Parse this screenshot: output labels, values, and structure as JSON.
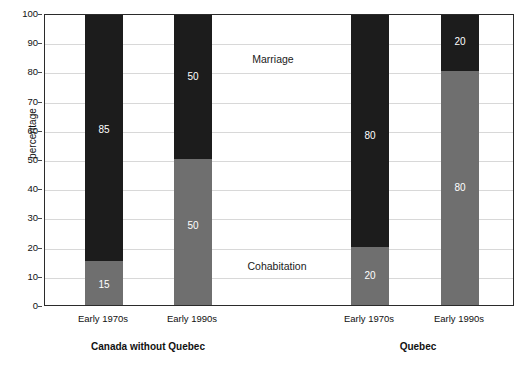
{
  "chart_data": {
    "type": "bar",
    "subtype": "stacked-100-percent",
    "title": "",
    "xlabel": "",
    "ylabel": "percentage",
    "ylim": [
      0,
      100
    ],
    "yticks": [
      0,
      10,
      20,
      30,
      40,
      50,
      60,
      70,
      80,
      90,
      100
    ],
    "grid": true,
    "legend_position": "in-plot-annotations",
    "categories": [
      "Early 1970s",
      "Early 1990s",
      "Early 1970s",
      "Early 1990s"
    ],
    "groups": [
      {
        "name": "Canada without Quebec",
        "categories": [
          "Early 1970s",
          "Early 1990s"
        ]
      },
      {
        "name": "Quebec",
        "categories": [
          "Early 1970s",
          "Early 1990s"
        ]
      }
    ],
    "series": [
      {
        "name": "Cohabitation",
        "color": "#6f6f6f",
        "values": [
          15,
          50,
          20,
          80
        ]
      },
      {
        "name": "Marriage",
        "color": "#1c1c1c",
        "values": [
          85,
          50,
          80,
          20
        ]
      }
    ],
    "annotations": [
      {
        "text": "Marriage",
        "x_px": 272,
        "y_px": 58
      },
      {
        "text": "Cohabitation",
        "x_px": 276,
        "y_px": 265
      }
    ],
    "bars": [
      {
        "group": "Canada without Quebec",
        "category": "Early 1970s",
        "x_center_px": 103,
        "segments": [
          {
            "series": "Cohabitation",
            "value": 15,
            "label": "15",
            "label_at": 7
          },
          {
            "series": "Marriage",
            "value": 85,
            "label": "85",
            "label_at": 60
          }
        ]
      },
      {
        "group": "Canada without Quebec",
        "category": "Early 1990s",
        "x_center_px": 192,
        "segments": [
          {
            "series": "Cohabitation",
            "value": 50,
            "label": "50",
            "label_at": 27
          },
          {
            "series": "Marriage",
            "value": 50,
            "label": "50",
            "label_at": 78
          }
        ]
      },
      {
        "group": "Quebec",
        "category": "Early 1970s",
        "x_center_px": 369,
        "segments": [
          {
            "series": "Cohabitation",
            "value": 20,
            "label": "20",
            "label_at": 10
          },
          {
            "series": "Marriage",
            "value": 80,
            "label": "80",
            "label_at": 58
          }
        ]
      },
      {
        "group": "Quebec",
        "category": "Early 1990s",
        "x_center_px": 459,
        "segments": [
          {
            "series": "Cohabitation",
            "value": 80,
            "label": "80",
            "label_at": 40
          },
          {
            "series": "Marriage",
            "value": 20,
            "label": "20",
            "label_at": 90
          }
        ]
      }
    ],
    "axis_tick_labels": [
      {
        "text": "Early 1970s",
        "x_px": 103
      },
      {
        "text": "Early 1990s",
        "x_px": 192
      },
      {
        "text": "Early 1970s",
        "x_px": 369
      },
      {
        "text": "Early 1990s",
        "x_px": 459
      }
    ],
    "group_labels": [
      {
        "text": "Canada without Quebec",
        "x_px": 148
      },
      {
        "text": "Quebec",
        "x_px": 418
      }
    ]
  },
  "colors": {
    "marriage": "#1c1c1c",
    "cohabitation": "#6f6f6f",
    "gridline": "#d8d8d8",
    "frame": "#2b2b2b",
    "background": "#ffffff",
    "text": "#1a1a1a",
    "value_label_text": "#ffffff"
  }
}
